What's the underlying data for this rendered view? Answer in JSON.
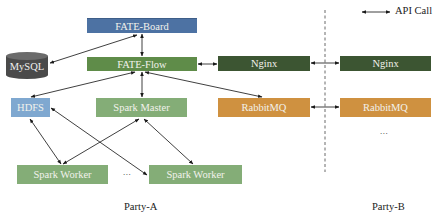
{
  "diagram": {
    "legend": {
      "label": "API Call",
      "icon": "double-arrow-icon"
    },
    "nodes": {
      "fate_board": "FATE-Board",
      "fate_flow": "FATE-Flow",
      "mysql": "MySQL",
      "nginx_a": "Nginx",
      "nginx_b": "Nginx",
      "hdfs": "HDFS",
      "spark_master": "Spark Master",
      "rabbitmq_a": "RabbitMQ",
      "rabbitmq_b": "RabbitMQ",
      "spark_worker_1": "Spark Worker",
      "spark_worker_2": "Spark Worker"
    },
    "ellipsis_workers": "...",
    "ellipsis_party_b": "...",
    "parties": {
      "a": "Party-A",
      "b": "Party-B"
    },
    "edges": [
      [
        "fate_board",
        "fate_flow"
      ],
      [
        "mysql",
        "fate_board"
      ],
      [
        "fate_flow",
        "nginx_a"
      ],
      [
        "nginx_a",
        "nginx_b"
      ],
      [
        "rabbitmq_a",
        "rabbitmq_b"
      ],
      [
        "fate_flow",
        "hdfs"
      ],
      [
        "fate_flow",
        "spark_master"
      ],
      [
        "fate_flow",
        "rabbitmq_a"
      ],
      [
        "hdfs",
        "spark_worker_1"
      ],
      [
        "hdfs",
        "spark_worker_2"
      ],
      [
        "spark_master",
        "spark_worker_1"
      ],
      [
        "spark_master",
        "spark_worker_2"
      ]
    ],
    "colors": {
      "fate_board": "#4d72a3",
      "fate_flow": "#5f8c49",
      "nginx": "#3c5532",
      "spark": "#84ad77",
      "hdfs": "#7fa8d0",
      "rabbitmq": "#cf9140",
      "mysql": "#4a4a4a"
    }
  }
}
